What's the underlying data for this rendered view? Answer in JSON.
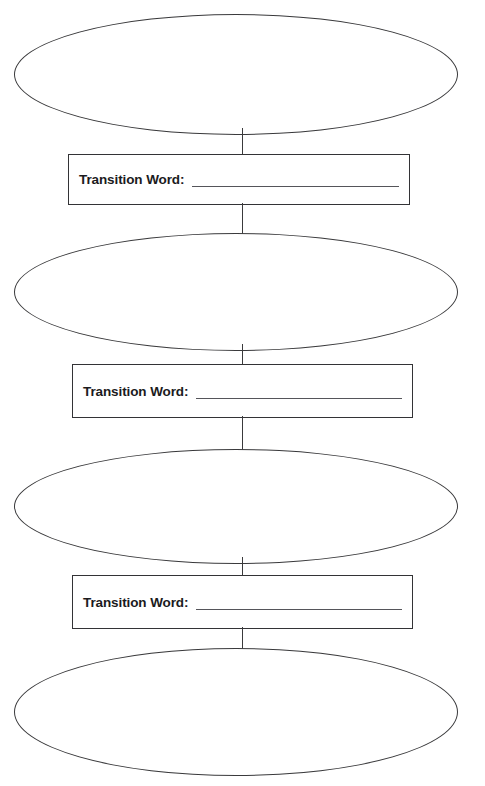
{
  "page": {
    "background_color": "#ffffff",
    "line_color": "#3a3a3c",
    "text_color": "#1b1b1d",
    "header_remnant": "",
    "width": 485,
    "height": 786
  },
  "organizer": {
    "type": "sequence-chain",
    "oval_count": 4,
    "transition_box_count": 3,
    "ovals": [
      {
        "index": 1,
        "content": "",
        "placeholder": ""
      },
      {
        "index": 2,
        "content": "",
        "placeholder": ""
      },
      {
        "index": 3,
        "content": "",
        "placeholder": ""
      },
      {
        "index": 4,
        "content": "",
        "placeholder": ""
      }
    ],
    "transitions": [
      {
        "index": 1,
        "label": "Transition Word:",
        "value": "",
        "placeholder": ""
      },
      {
        "index": 2,
        "label": "Transition Word:",
        "value": "",
        "placeholder": ""
      },
      {
        "index": 3,
        "label": "Transition Word:",
        "value": "",
        "placeholder": ""
      }
    ]
  }
}
